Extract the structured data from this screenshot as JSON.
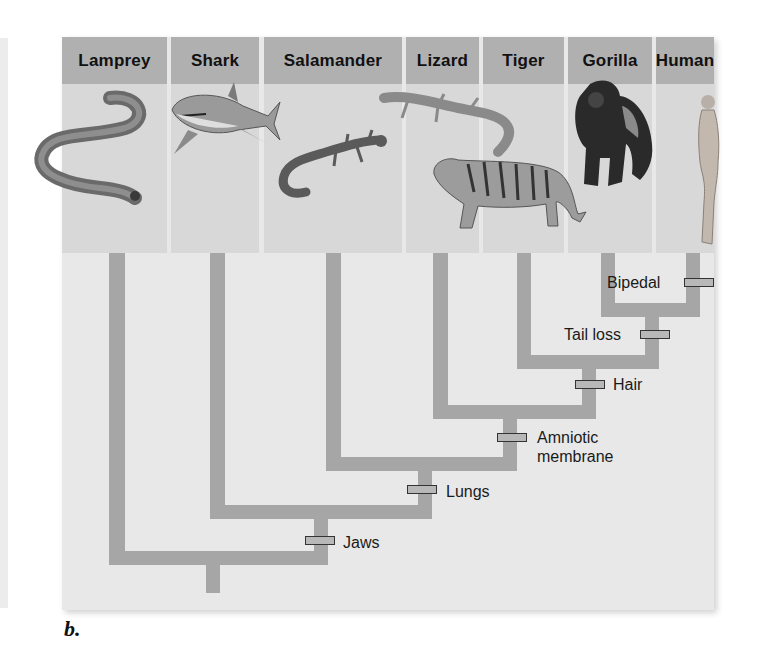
{
  "figure_label": "b.",
  "taxa": [
    {
      "name": "Lamprey",
      "icon": "lamprey-icon"
    },
    {
      "name": "Shark",
      "icon": "shark-icon"
    },
    {
      "name": "Salamander",
      "icon": "salamander-icon"
    },
    {
      "name": "Lizard",
      "icon": "lizard-icon"
    },
    {
      "name": "Tiger",
      "icon": "tiger-icon"
    },
    {
      "name": "Gorilla",
      "icon": "gorilla-icon"
    },
    {
      "name": "Human",
      "icon": "human-icon"
    }
  ],
  "traits": [
    {
      "label": "Jaws"
    },
    {
      "label": "Lungs"
    },
    {
      "label": "Amniotic membrane",
      "line1": "Amniotic",
      "line2": "membrane"
    },
    {
      "label": "Hair"
    },
    {
      "label": "Tail loss"
    },
    {
      "label": "Bipedal"
    }
  ],
  "colors": {
    "header": "#b0b0b0",
    "panel": "#e8e8e8",
    "branch": "#a6a6a6",
    "trait_marker": "#b8b8b8"
  }
}
